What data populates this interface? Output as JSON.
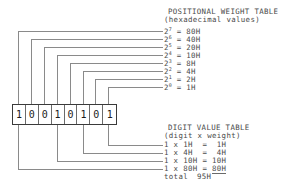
{
  "binary": {
    "label": "binary-number",
    "digits": [
      "1",
      "0",
      "0",
      "1",
      "0",
      "1",
      "0",
      "1"
    ]
  },
  "positional_weight_table": {
    "title": "POSITIONAL WEIGHT TABLE",
    "subtitle": "(hexadecimal values)",
    "rows": [
      {
        "base": "2",
        "exp": "7",
        "eq": " = ",
        "value": "80H"
      },
      {
        "base": "2",
        "exp": "6",
        "eq": " = ",
        "value": "40H"
      },
      {
        "base": "2",
        "exp": "5",
        "eq": " = ",
        "value": "20H"
      },
      {
        "base": "2",
        "exp": "4",
        "eq": " = ",
        "value": "10H"
      },
      {
        "base": "2",
        "exp": "3",
        "eq": " = ",
        "value": "8H"
      },
      {
        "base": "2",
        "exp": "2",
        "eq": " = ",
        "value": "4H"
      },
      {
        "base": "2",
        "exp": "1",
        "eq": " = ",
        "value": "2H"
      },
      {
        "base": "2",
        "exp": "0",
        "eq": " = ",
        "value": "1H"
      }
    ]
  },
  "digit_value_table": {
    "title": "DIGIT VALUE TABLE",
    "subtitle": "(digit x weight)",
    "rows": [
      {
        "expr": "1 x 1H  = ",
        "amount": " 1H"
      },
      {
        "expr": "1 x 4H  = ",
        "amount": " 4H"
      },
      {
        "expr": "1 x 10H = ",
        "amount": "10H"
      },
      {
        "expr": "1 x 80H = ",
        "amount": "80H"
      }
    ],
    "total_label": "total",
    "total_value": "95H"
  },
  "style": {
    "wire_color": "#8a8a8a",
    "box_border": "#3a3a3a",
    "text_color": "#4a4a4a"
  }
}
